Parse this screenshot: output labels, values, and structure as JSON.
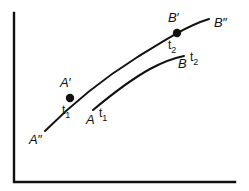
{
  "figure": {
    "background_color": "#ffffff",
    "ink_color": "#111111",
    "axes": {
      "name": "axis-corner",
      "y_axis": {
        "x": 14,
        "y_top": 13,
        "y_bottom": 182
      },
      "x_axis": {
        "y": 182,
        "x_left": 14,
        "x_right": 235
      },
      "stroke_width": 2.4,
      "x_label": "",
      "y_label": "",
      "ticks": []
    },
    "labels": [
      {
        "id": "A-double-prime",
        "base": "A",
        "primes": "″",
        "sub": "",
        "x": 29,
        "y": 133,
        "note": "start of upper curve"
      },
      {
        "id": "A-prime",
        "base": "A",
        "primes": "′",
        "sub": "",
        "x": 60,
        "y": 76,
        "note": "above first marked dot"
      },
      {
        "id": "t1-upper",
        "base": "t",
        "primes": "",
        "sub": "1",
        "x": 62,
        "y": 103,
        "note": "below first marked dot"
      },
      {
        "id": "A",
        "base": "A",
        "primes": "",
        "sub": "",
        "x": 86,
        "y": 113,
        "note": "start of lower curve"
      },
      {
        "id": "t1-lower",
        "base": "t",
        "primes": "",
        "sub": "1",
        "x": 99,
        "y": 106,
        "note": "beside A"
      },
      {
        "id": "B-prime",
        "base": "B",
        "primes": "′",
        "sub": "",
        "x": 168,
        "y": 11,
        "note": "above second marked dot"
      },
      {
        "id": "t2-upper",
        "base": "t",
        "primes": "",
        "sub": "2",
        "x": 168,
        "y": 38,
        "note": "below second marked dot"
      },
      {
        "id": "B-double-prime",
        "base": "B",
        "primes": "″",
        "sub": "",
        "x": 214,
        "y": 16,
        "note": "end of upper curve"
      },
      {
        "id": "B",
        "base": "B",
        "primes": "",
        "sub": "",
        "x": 178,
        "y": 57,
        "note": "end of lower curve"
      },
      {
        "id": "t2-lower",
        "base": "t",
        "primes": "",
        "sub": "2",
        "x": 190,
        "y": 50,
        "note": "beside B"
      }
    ],
    "curves": [
      {
        "id": "upper-curve",
        "name": "curve-A-double-prime-to-B-double-prime",
        "from": "A″",
        "to": "B″",
        "stroke_width": 2.0,
        "path": "M 45 131 C 72 104, 104 78, 136 58 C 160 43, 186 26, 209 19"
      },
      {
        "id": "lower-curve",
        "name": "curve-A-to-B",
        "from": "A",
        "to": "B",
        "stroke_width": 2.0,
        "path": "M 93 110 C 111 95, 130 80, 150 69 C 163 62, 174 58, 184 56"
      }
    ],
    "points": [
      {
        "id": "point-t1",
        "label": "A′",
        "time": "t₁",
        "x": 70,
        "y": 98,
        "r": 4.2
      },
      {
        "id": "point-t2",
        "label": "B′",
        "time": "t₂",
        "x": 177,
        "y": 33,
        "r": 4.2
      }
    ]
  }
}
